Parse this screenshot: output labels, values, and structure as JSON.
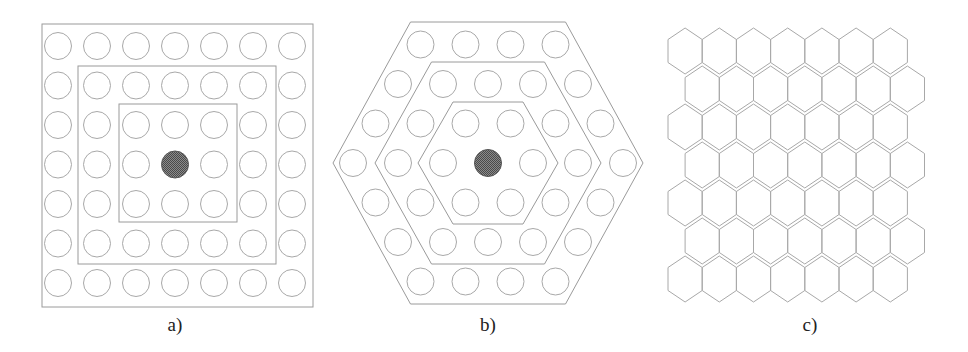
{
  "figure": {
    "line_color": "#a8a8a8",
    "frame_color": "#9a9a9a",
    "fill_color": "#6a6a6a",
    "panels": [
      {
        "id": "a",
        "label": "a)",
        "label_pos": [
          175,
          314
        ],
        "layout": "square-grid",
        "grid": {
          "cols": 7,
          "rows": 7,
          "x0": 58,
          "y0": 46,
          "dx": 39,
          "dy": 39.5,
          "r": 13.5
        },
        "filled_cell": [
          3,
          3
        ],
        "frames": [
          {
            "x": 42,
            "y": 24,
            "w": 271,
            "h": 283
          },
          {
            "x": 78,
            "y": 66,
            "w": 198,
            "h": 198
          },
          {
            "x": 119,
            "y": 104,
            "w": 118,
            "h": 118
          }
        ]
      },
      {
        "id": "b",
        "label": "b)",
        "label_pos": [
          488,
          314
        ],
        "layout": "hex-circle-grid",
        "center": [
          488,
          163
        ],
        "spacing": 45,
        "row_dy": 39.5,
        "r": 13.5,
        "rings": 3,
        "frames_hex": [
          {
            "cx": 488,
            "cy": 163,
            "half_w": 155,
            "half_h": 141
          },
          {
            "cx": 488,
            "cy": 163,
            "half_w": 113,
            "half_h": 101
          },
          {
            "cx": 488,
            "cy": 163,
            "half_w": 70,
            "half_h": 61
          }
        ]
      },
      {
        "id": "c",
        "label": "c)",
        "label_pos": [
          810,
          314
        ],
        "layout": "hexagon-tiling",
        "cols": 7,
        "rows": 7,
        "x0": 668,
        "y0": 28,
        "w": 34.2,
        "h": 46,
        "row_dy": 38
      }
    ]
  }
}
